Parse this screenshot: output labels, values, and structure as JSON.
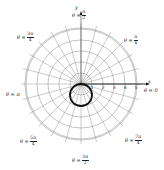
{
  "figure": {
    "center_px": [
      81,
      84
    ],
    "px_per_unit": 11,
    "grid": {
      "rings": [
        1,
        2,
        3,
        4,
        5
      ],
      "radial_step_deg": 15,
      "outer_radius_units": 5.1,
      "spoke_extension_units": 0.35,
      "grid_color": "#8a8a8a",
      "axis_color": "#111111"
    },
    "curve": {
      "equation": "r = -2 sin θ",
      "center_units": [
        0,
        -1
      ],
      "radius_units": 1,
      "color": "#111111",
      "stroke_width": 1.8
    },
    "axes": {
      "x_label": "x",
      "y_label": "y",
      "x_ticks": [
        "1",
        "2",
        "3",
        "4",
        "5"
      ]
    },
    "angle_labels": {
      "top": {
        "prefix": "θ =",
        "num": "π",
        "den": "2"
      },
      "top_left": {
        "prefix": "θ =",
        "num": "3π",
        "den": "4"
      },
      "top_right": {
        "prefix": "θ =",
        "num": "π",
        "den": "4"
      },
      "left": {
        "text": "θ = π"
      },
      "right": {
        "text": "θ = 0"
      },
      "bottom_left": {
        "prefix": "θ =",
        "num": "5π",
        "den": "4"
      },
      "bottom_right": {
        "prefix": "θ =",
        "num": "7π",
        "den": "4"
      },
      "bottom": {
        "prefix": "θ =",
        "num": "3π",
        "den": "2"
      }
    }
  }
}
